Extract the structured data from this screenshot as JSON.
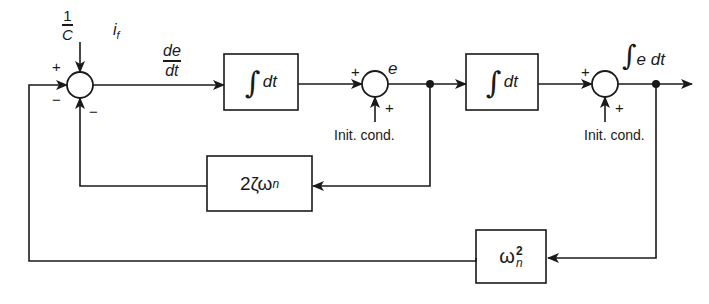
{
  "diagram": {
    "type": "block-diagram",
    "input": {
      "label_numerator": "1",
      "label_denominator": "C",
      "label_signal": "i",
      "label_signal_sub": "f"
    },
    "signals": {
      "de_dt_num": "de",
      "de_dt_den": "dt",
      "e": "e",
      "integral_symbol": "∫",
      "output_rest": "e dt"
    },
    "blocks": [
      {
        "id": "integrator-1",
        "symbol": "∫",
        "text": "dt"
      },
      {
        "id": "integrator-2",
        "symbol": "∫",
        "text": "dt"
      },
      {
        "id": "damping-gain",
        "text": "2ζω",
        "sub": "n"
      },
      {
        "id": "frequency-gain",
        "text": "ω",
        "sup": "2",
        "sub": "n"
      }
    ],
    "summers": [
      {
        "id": "summer-1",
        "signs": {
          "top_left": "+",
          "left_below": "−",
          "bottom_right": "−"
        }
      },
      {
        "id": "summer-2",
        "signs": {
          "left": "+",
          "bottom": "+"
        },
        "side_input": "Init. cond."
      },
      {
        "id": "summer-3",
        "signs": {
          "left": "+",
          "bottom": "+"
        },
        "side_input": "Init. cond."
      }
    ],
    "colors": {
      "ink": "#1a1a1a",
      "background": "#ffffff"
    }
  }
}
